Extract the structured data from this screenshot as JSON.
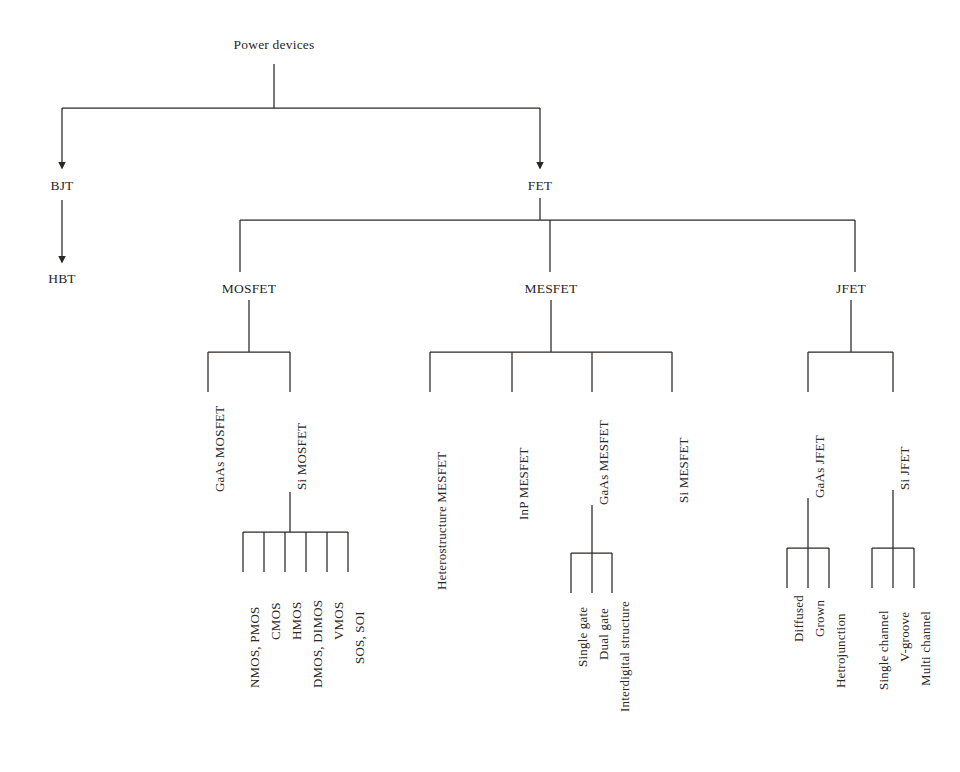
{
  "diagram": {
    "line_color": "#2b2725",
    "text_color": "#2b2725",
    "background": "#ffffff",
    "root": {
      "label": "Power devices"
    },
    "level1": [
      {
        "label": "BJT"
      },
      {
        "label": "FET"
      }
    ],
    "bjt_children": [
      {
        "label": "HBT"
      }
    ],
    "fet_children": [
      {
        "label": "MOSFET"
      },
      {
        "label": "MESFET"
      },
      {
        "label": "JFET"
      }
    ],
    "mosfet_children": [
      {
        "label": "GaAs MOSFET"
      },
      {
        "label": "Si MOSFET"
      }
    ],
    "si_mosfet_children": [
      {
        "label": "NMOS, PMOS"
      },
      {
        "label": "CMOS"
      },
      {
        "label": "HMOS"
      },
      {
        "label": "DMOS, DIMOS"
      },
      {
        "label": "VMOS"
      },
      {
        "label": "SOS, SOI"
      }
    ],
    "mesfet_children": [
      {
        "label": "Heterostructure  MESFET"
      },
      {
        "label": "InP  MESFET"
      },
      {
        "label": "GaAs  MESFET"
      },
      {
        "label": "Si MESFET"
      }
    ],
    "gaas_mesfet_children": [
      {
        "label": "Single gate"
      },
      {
        "label": "Dual gate"
      },
      {
        "label": "Interdigital structure"
      }
    ],
    "jfet_children": [
      {
        "label": "GaAs JFET"
      },
      {
        "label": "Si JFET"
      }
    ],
    "gaas_jfet_children": [
      {
        "label": "Diffused"
      },
      {
        "label": "Grown"
      },
      {
        "label": "Hetrojunction"
      }
    ],
    "si_jfet_children": [
      {
        "label": "Single channel"
      },
      {
        "label": "V-groove"
      },
      {
        "label": "Multi channel"
      }
    ]
  }
}
